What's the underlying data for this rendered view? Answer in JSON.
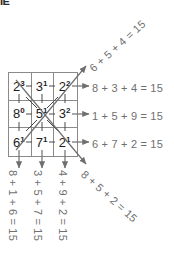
{
  "figure": {
    "type": "magic-square-diagram",
    "crop_artifact_text": "ΙΕ",
    "colors": {
      "grid_line": "#8a8a8a",
      "cell_number": "#1d1d1d",
      "equation_text": "#6f6f6f",
      "arrow": "#6f6f6f",
      "background": "#ffffff"
    },
    "grid": {
      "rows": 3,
      "cols": 3,
      "cells": [
        [
          {
            "base": "2",
            "exp": "3",
            "value": 8
          },
          {
            "base": "3",
            "exp": "1",
            "value": 3
          },
          {
            "base": "2",
            "exp": "2",
            "value": 4
          }
        ],
        [
          {
            "base": "8",
            "exp": "0",
            "value": 1
          },
          {
            "base": "5",
            "exp": "1",
            "value": 5
          },
          {
            "base": "3",
            "exp": "2",
            "value": 9
          }
        ],
        [
          {
            "base": "6",
            "exp": "1",
            "value": 6
          },
          {
            "base": "7",
            "exp": "1",
            "value": 7
          },
          {
            "base": "2",
            "exp": "1",
            "value": 2
          }
        ]
      ]
    },
    "row_equations": [
      "8 + 3 + 4 = 15",
      "1 + 5 + 9 = 15",
      "6 + 7 + 2 = 15"
    ],
    "column_equations": [
      "8 + 1 + 6 = 15",
      "3 + 5 + 7 = 15",
      "4 + 9 + 2 = 15"
    ],
    "diagonal_equations": {
      "up_right": "6 + 5 + 4 = 15",
      "down_right": "8 + 5 + 2 = 15"
    },
    "magic_constant": 15
  }
}
